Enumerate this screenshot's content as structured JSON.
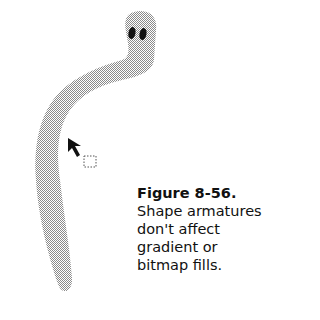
{
  "figure": {
    "label": "Figure 8-56.",
    "caption_lines": [
      "Shape armatures",
      "don't affect",
      "gradient or",
      "bitmap fills."
    ]
  },
  "illustration": {
    "subject": "worm-shape-with-armature",
    "fill_color": "#b8b8b8",
    "eye_color": "#111111",
    "cursor": "arrow-cursor-with-marquee"
  }
}
